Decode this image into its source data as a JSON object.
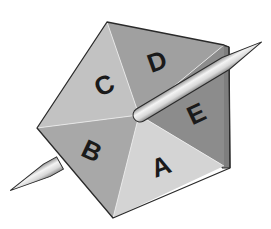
{
  "diagram": {
    "type": "pentagonal-spinner",
    "faces": [
      {
        "id": "A",
        "label": "A",
        "color": "#d4d4d4"
      },
      {
        "id": "B",
        "label": "B",
        "color": "#a6a6a6"
      },
      {
        "id": "C",
        "label": "C",
        "color": "#c2c2c2"
      },
      {
        "id": "D",
        "label": "D",
        "color": "#a0a0a0"
      },
      {
        "id": "E",
        "label": "E",
        "color": "#8a8a8a"
      }
    ],
    "side_color": "#7e7e7e",
    "spindle": {
      "color": "#dcdcdc",
      "highlight": "#f6f6f6",
      "outline": "#2a2a2a"
    },
    "background": "#ffffff"
  }
}
